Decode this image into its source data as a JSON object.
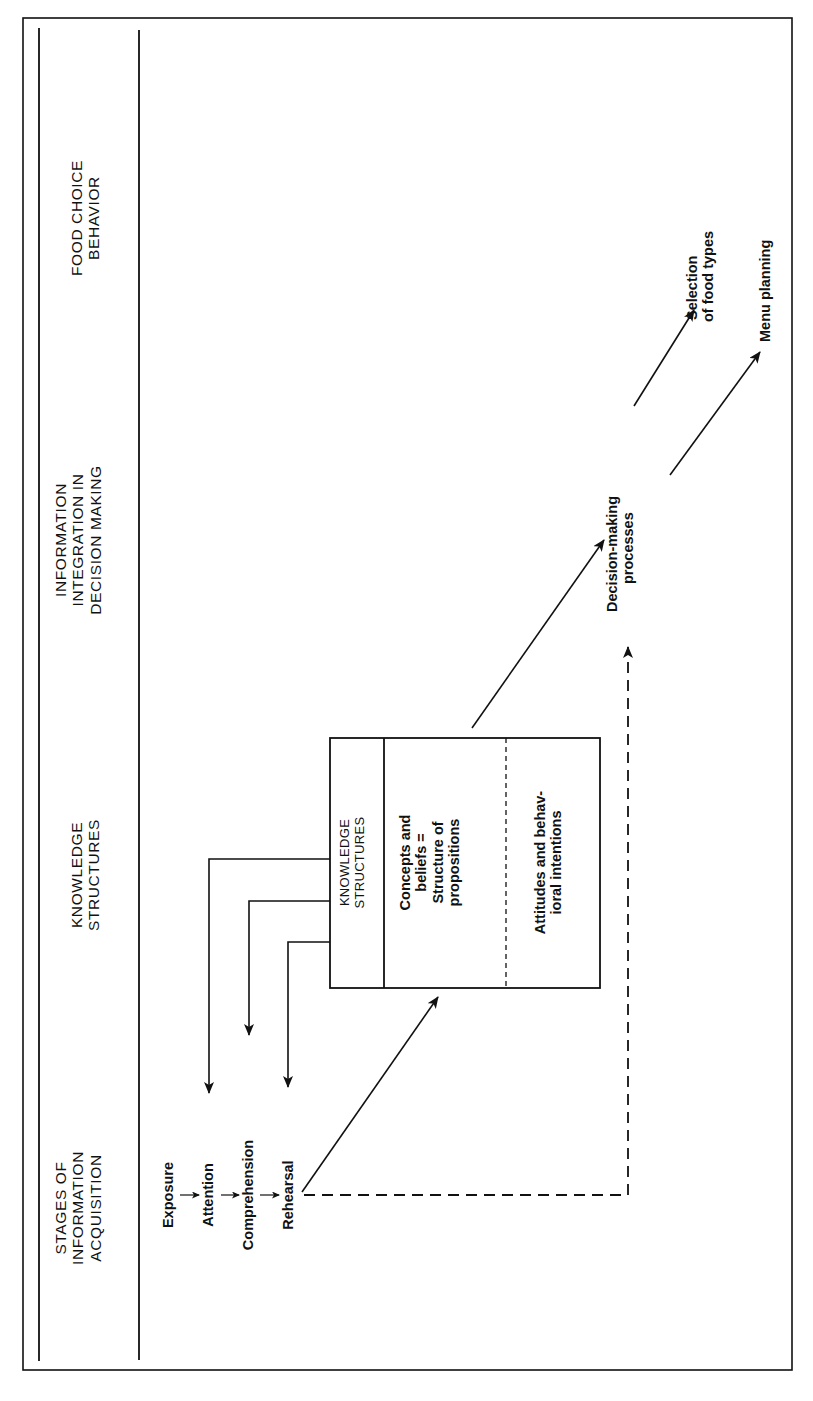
{
  "headers": {
    "stages": [
      "STAGES OF",
      "INFORMATION",
      "ACQUISITION"
    ],
    "knowledge": [
      "KNOWLEDGE",
      "STRUCTURES"
    ],
    "integration": [
      "INFORMATION",
      "INTEGRATION IN",
      "DECISION MAKING"
    ],
    "behavior": [
      "FOOD CHOICE",
      "BEHAVIOR"
    ]
  },
  "stages": {
    "items": [
      "Exposure",
      "Attention",
      "Comprehension",
      "Rehearsal"
    ]
  },
  "knowledge_box": {
    "title": [
      "KNOWLEDGE",
      "STRUCTURES"
    ],
    "concepts": [
      "Concepts and",
      "beliefs =",
      "Structure of",
      "propositions"
    ],
    "attitudes": [
      "Attitudes and behav-",
      "ioral intentions"
    ]
  },
  "decision": {
    "label": [
      "Decision-making",
      "processes"
    ]
  },
  "outcomes": {
    "selection": [
      "Selection",
      "of food types"
    ],
    "menu": [
      "Menu planning"
    ]
  },
  "colors": {
    "ink": "#111111",
    "paper": "#ffffff"
  }
}
